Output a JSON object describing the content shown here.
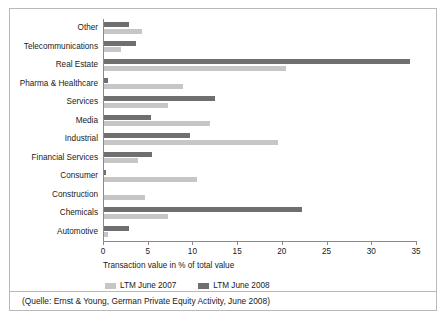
{
  "chart_data": {
    "type": "bar",
    "orientation": "horizontal",
    "title": "",
    "xlabel": "Transaction value in % of total value",
    "ylabel": "",
    "xlim": [
      0,
      35
    ],
    "xticks": [
      0,
      5,
      10,
      15,
      20,
      25,
      30,
      35
    ],
    "grid": false,
    "legend_position": "bottom",
    "categories": [
      "Other",
      "Telecommunications",
      "Real Estate",
      "Pharma & Healthcare",
      "Services",
      "Media",
      "Industrial",
      "Financial Services",
      "Consumer",
      "Construction",
      "Chemicals",
      "Automotive"
    ],
    "series": [
      {
        "name": "LTM June 2008",
        "color": "#6f6f6f",
        "values": [
          2.8,
          3.6,
          34.2,
          0.5,
          12.4,
          5.3,
          9.6,
          5.4,
          0.2,
          0.0,
          22.1,
          2.8
        ]
      },
      {
        "name": "LTM June 2007",
        "color": "#c6c6c6",
        "values": [
          4.2,
          1.9,
          20.4,
          8.8,
          7.2,
          11.9,
          19.5,
          3.8,
          10.4,
          4.6,
          7.2,
          0.4
        ]
      }
    ]
  },
  "legend": {
    "items": [
      {
        "label": "LTM June 2007",
        "color": "#c6c6c6"
      },
      {
        "label": "LTM June 2008",
        "color": "#6f6f6f"
      }
    ]
  },
  "caption": {
    "text": "(Quelle: Ernst & Young, German Private Equity Activity, June 2008)"
  }
}
